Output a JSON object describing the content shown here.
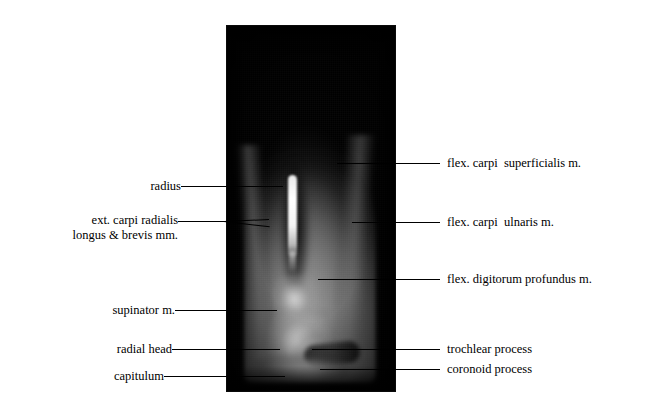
{
  "figure": {
    "type": "annotated-mri-sagittal-section",
    "modality": "MRI",
    "region": "elbow / proximal forearm, sagittal section",
    "image_panel": {
      "background_color": "#000000",
      "x": 226,
      "y": 25,
      "width": 170,
      "height": 367
    }
  },
  "labels_left": [
    {
      "id": "radius",
      "text": "radius",
      "x": 131,
      "y": 179,
      "leader_x1": 181,
      "leader_x2": 283,
      "leader_y": 186
    },
    {
      "id": "ext-carpi-radialis",
      "text": "ext. carpi radialis",
      "line2": "longus & brevis mm.",
      "x": 50,
      "y": 213,
      "leader_x1": 178,
      "leader_x2": 268,
      "leader_y": 221
    },
    {
      "id": "supinator",
      "text": "supinator m.",
      "x": 89,
      "y": 303,
      "leader_x1": 175,
      "leader_x2": 277,
      "leader_y": 310
    },
    {
      "id": "radial-head",
      "text": "radial head",
      "x": 97,
      "y": 342,
      "leader_x1": 172,
      "leader_x2": 280,
      "leader_y": 349
    },
    {
      "id": "capitulum",
      "text": "capitulum",
      "x": 100,
      "y": 369,
      "leader_x1": 164,
      "leader_x2": 285,
      "leader_y": 376
    }
  ],
  "labels_right": [
    {
      "id": "flex-carpi-superficialis",
      "text": "flex. carpi  superficialis m.",
      "x": 447,
      "y": 156,
      "leader_x1": 337,
      "leader_x2": 440,
      "leader_y": 163
    },
    {
      "id": "flex-carpi-ulnaris",
      "text": "flex. carpi  ulnaris m.",
      "x": 447,
      "y": 215,
      "leader_x1": 352,
      "leader_x2": 440,
      "leader_y": 222
    },
    {
      "id": "flex-digitorum-profundus",
      "text": "flex. digitorum profundus m.",
      "x": 447,
      "y": 272,
      "leader_x1": 318,
      "leader_x2": 440,
      "leader_y": 279
    },
    {
      "id": "trochlear-process",
      "text": "trochlear process",
      "x": 447,
      "y": 342,
      "leader_x1": 312,
      "leader_x2": 440,
      "leader_y": 349
    },
    {
      "id": "coronoid-process",
      "text": "coronoid process",
      "x": 447,
      "y": 362,
      "leader_x1": 320,
      "leader_x2": 440,
      "leader_y": 369
    }
  ],
  "colors": {
    "background": "#ffffff",
    "text": "#000000",
    "leader_line": "#000000",
    "image_background": "#000000",
    "bright_marrow": "#ffffff",
    "soft_tissue_gray": "#808080"
  }
}
